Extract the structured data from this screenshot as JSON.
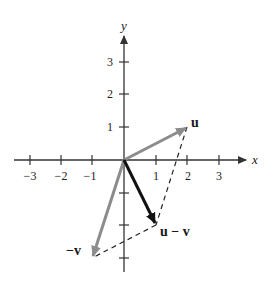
{
  "diagram": {
    "title": "",
    "axes": {
      "x_label": "x",
      "y_label": "y",
      "x_ticks": [
        {
          "value": -3,
          "label": "−3"
        },
        {
          "value": -2,
          "label": "−2"
        },
        {
          "value": -1,
          "label": "−1"
        },
        {
          "value": 1,
          "label": "1"
        },
        {
          "value": 2,
          "label": "2"
        },
        {
          "value": 3,
          "label": "3"
        }
      ],
      "y_ticks": [
        {
          "value": 1,
          "label": "1"
        },
        {
          "value": 2,
          "label": "2"
        },
        {
          "value": 3,
          "label": "3"
        }
      ],
      "y_unlabeled_ticks": [
        -1,
        -2,
        -3
      ]
    },
    "vectors": [
      {
        "name": "u",
        "label": "u",
        "from": [
          0,
          0
        ],
        "to": [
          2,
          1
        ],
        "color": "#8c8c8c"
      },
      {
        "name": "u-v",
        "label": "u − v",
        "from": [
          0,
          0
        ],
        "to": [
          1,
          -2
        ],
        "color": "#111111"
      },
      {
        "name": "-v",
        "label": "−v",
        "from": [
          0,
          0
        ],
        "to": [
          -1,
          -3
        ],
        "color": "#8c8c8c"
      }
    ],
    "dashed_segments": [
      {
        "from": [
          2,
          1
        ],
        "to": [
          1,
          -2
        ]
      },
      {
        "from": [
          1,
          -2
        ],
        "to": [
          -1,
          -3
        ]
      }
    ],
    "colors": {
      "axis": "#333333",
      "gray_vector": "#8c8c8c",
      "black_vector": "#111111",
      "dashed": "#222222"
    }
  }
}
